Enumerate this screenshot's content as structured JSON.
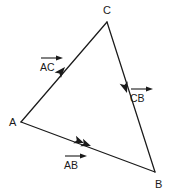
{
  "diagram": {
    "type": "vector-triangle",
    "background_color": "#ffffff",
    "line_color": "#1a1a1a",
    "text_color": "#1a1a1a",
    "vertices": [
      {
        "name": "A",
        "label": "A",
        "label_x": 10,
        "label_y": 126,
        "point_x": 21,
        "point_y": 122
      },
      {
        "name": "C",
        "label": "C",
        "label_x": 103,
        "label_y": 14,
        "point_x": 107,
        "point_y": 22
      },
      {
        "name": "B",
        "label": "B",
        "label_x": 155,
        "label_y": 187,
        "point_x": 155,
        "point_y": 172
      }
    ],
    "edges": [
      {
        "name": "AC",
        "from": "A",
        "to": "C"
      },
      {
        "name": "CB",
        "from": "C",
        "to": "B"
      },
      {
        "name": "AB",
        "from": "A",
        "to": "B"
      }
    ],
    "vectors": [
      {
        "name": "AC",
        "label": "AC",
        "notation": "over-arrow",
        "label_x": 40,
        "label_y": 70,
        "overbar_x1": 41,
        "overbar_x2": 62,
        "overbar_y": 58,
        "edge_arrow_x": 65,
        "edge_arrow_y": 67,
        "edge_arrow_angle": -53,
        "direction": "toward-C"
      },
      {
        "name": "CB",
        "label": "CB",
        "notation": "over-arrow",
        "label_x": 130,
        "label_y": 101,
        "overbar_x1": 131,
        "overbar_x2": 152,
        "overbar_y": 89,
        "edge_arrow_x": 127,
        "edge_arrow_y": 93,
        "edge_arrow_angle": 108,
        "direction": "toward-B"
      },
      {
        "name": "AB",
        "label": "AB",
        "notation": "over-arrow",
        "label_x": 64,
        "label_y": 168,
        "overbar_x1": 65,
        "overbar_x2": 86,
        "overbar_y": 156,
        "edge_arrow_x": 82,
        "edge_arrow_y": 143,
        "edge_arrow_x2": 89,
        "edge_arrow_y2": 145,
        "edge_arrow_angle": 17,
        "direction": "toward-B",
        "double_arrow": true
      }
    ]
  }
}
